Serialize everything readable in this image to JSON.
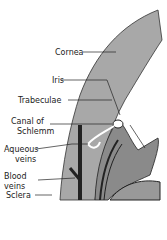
{
  "diagram": {
    "labels": {
      "cornea": "Cornea",
      "iris": "Iris",
      "trabeculae": "Trabeculae",
      "canal_line1": "Canal of",
      "canal_line2": "Schlemm",
      "aqueous_line1": "Aqueous",
      "aqueous_line2": "veins",
      "blood_line1": "Blood",
      "blood_line2": "veins",
      "sclera": "Sclera"
    },
    "colors": {
      "tissue": "#a8a8a8",
      "dark": "#222222",
      "stipple": "#8a8a8a"
    }
  }
}
